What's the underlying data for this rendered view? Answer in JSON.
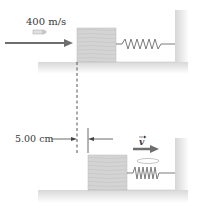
{
  "diagram": {
    "top_scene": {
      "bullet_speed_label": "400 m/s",
      "objects": [
        "bullet",
        "velocity-arrow",
        "wooden-block",
        "spring",
        "wall",
        "floor"
      ]
    },
    "bottom_scene": {
      "displacement_label": "5.00 cm",
      "velocity_vector_label": "v",
      "objects": [
        "wooden-block-with-embedded-bullet",
        "compressed-spring",
        "wall",
        "floor",
        "velocity-arrow"
      ]
    },
    "colors": {
      "block": "#d4d4d4",
      "block_grain": "#bdbdbd",
      "spring": "#7a7a7a",
      "arrow": "#6e6e6e",
      "floor_shadow": "#e6e6e6",
      "text": "#3a3a3a"
    }
  }
}
